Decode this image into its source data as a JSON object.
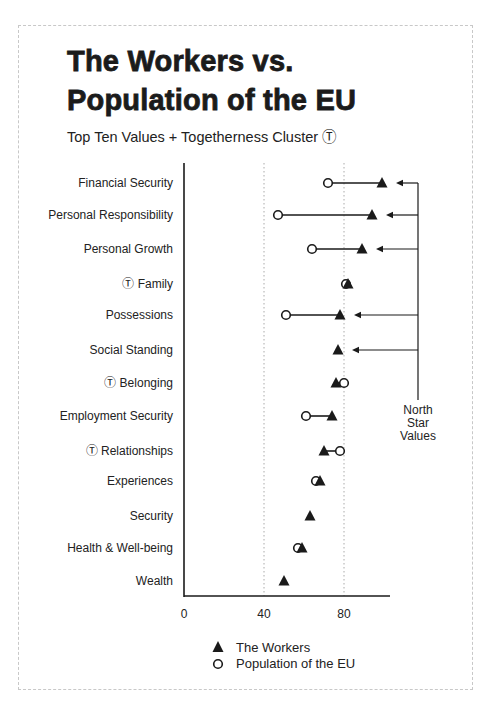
{
  "header": {
    "title_line1": "The Workers vs.",
    "title_line2": "Population of the EU",
    "subtitle": "Top Ten Values + Togetherness Cluster Ⓣ"
  },
  "annotation": {
    "lines": [
      "North",
      "Star",
      "Values"
    ],
    "targets": [
      "Financial Security",
      "Personal Responsibility",
      "Personal Growth",
      "Possessions",
      "Social Standing"
    ]
  },
  "legend": [
    {
      "marker": "triangle-filled",
      "label": "The Workers"
    },
    {
      "marker": "circle-open",
      "label": "Population of the EU"
    }
  ],
  "colors": {
    "ink": "#1a1a1a",
    "gridline": "#aaaaaa",
    "frame": "#c8c8c8"
  },
  "chart_data": {
    "type": "dot-plot (dumbbell)",
    "subtitle": "Top Ten Values + Togetherness Cluster Ⓣ",
    "xlabel": "",
    "ylabel": "",
    "xlim": [
      0,
      103
    ],
    "xticks": [
      0,
      40,
      80
    ],
    "grid": "dotted vertical at 40 and 80",
    "legend_position": "bottom",
    "togetherness_marker": "Ⓣ",
    "categories": [
      {
        "label": "Financial Security",
        "togetherness": false
      },
      {
        "label": "Personal Responsibility",
        "togetherness": false
      },
      {
        "label": "Personal Growth",
        "togetherness": false
      },
      {
        "label": "Family",
        "togetherness": true
      },
      {
        "label": "Possessions",
        "togetherness": false
      },
      {
        "label": "Social Standing",
        "togetherness": false
      },
      {
        "label": "Belonging",
        "togetherness": true
      },
      {
        "label": "Employment Security",
        "togetherness": false
      },
      {
        "label": "Relationships",
        "togetherness": true
      },
      {
        "label": "Experiences",
        "togetherness": false
      },
      {
        "label": "Security",
        "togetherness": false
      },
      {
        "label": "Health & Well-being",
        "togetherness": false
      },
      {
        "label": "Wealth",
        "togetherness": false
      }
    ],
    "series": [
      {
        "name": "The Workers",
        "marker": "triangle",
        "values": [
          99,
          94,
          89,
          82,
          78,
          77,
          76,
          74,
          70,
          68,
          63,
          59,
          50
        ]
      },
      {
        "name": "Population of the EU",
        "marker": "circle",
        "values": [
          72,
          47,
          64,
          81,
          51,
          null,
          80,
          61,
          78,
          66,
          null,
          57,
          null
        ]
      }
    ]
  }
}
